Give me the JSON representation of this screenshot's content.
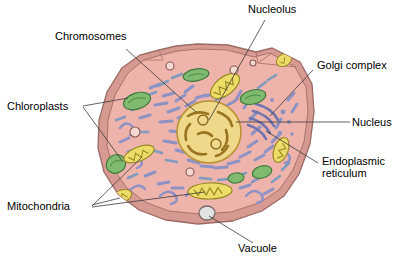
{
  "diagram": {
    "style": "hand-drawn colored biology illustration",
    "background_color": "#ffffff",
    "leader_line_color": "#3a3a3a"
  },
  "labels": [
    {
      "id": "chromosomes",
      "text": "Chromosomes",
      "x": 55,
      "y": 36,
      "align": "left"
    },
    {
      "id": "nucleolus",
      "text": "Nucleolus",
      "x": 248,
      "y": 8,
      "align": "left"
    },
    {
      "id": "golgi",
      "text": "Golgi complex",
      "x": 317,
      "y": 65,
      "align": "left"
    },
    {
      "id": "nucleus",
      "text": "Nucleus",
      "x": 352,
      "y": 117,
      "align": "left"
    },
    {
      "id": "er",
      "text": "Endoplasmic reticulum",
      "x": 322,
      "y": 161,
      "align": "left",
      "multiline": true
    },
    {
      "id": "vacuole",
      "text": "Vacuole",
      "x": 238,
      "y": 248,
      "align": "left"
    },
    {
      "id": "mitochondria",
      "text": "Mitochondria",
      "x": 7,
      "y": 202,
      "align": "left"
    },
    {
      "id": "chloroplasts",
      "text": "Chloroplasts",
      "x": 7,
      "y": 102,
      "align": "left"
    }
  ],
  "colors": {
    "cell_wall": "#d79a93",
    "cell_wall_outline": "#9c6a64",
    "cytoplasm": "#eeb3ab",
    "cytoplasm_outline": "#a8736c",
    "nucleus_fill": "#f0d88a",
    "nucleus_outline": "#b79335",
    "chromatin": "#9a7521",
    "nucleolus_fill": "#f0d88a",
    "nucleolus_outline": "#8a6a1c",
    "chloroplast_fill": "#7fba70",
    "chloroplast_outline": "#3f7a3a",
    "mitochondria_fill": "#eddc6a",
    "mitochondria_outline": "#9a8a22",
    "er_strand": "#8d92c4",
    "er_strand_alt": "#7f9bbf",
    "golgi": "#8d92c4",
    "vacuole_fill": "#e2e2e2",
    "vacuole_outline": "#7a6a66",
    "vesicle_fill": "#f6d9d3",
    "vesicle_outline": "#8a5f59"
  },
  "organelles": {
    "nucleus": {
      "label": "Nucleus",
      "cx": 209,
      "cy": 132,
      "rx": 32,
      "ry": 31
    },
    "nucleoli": [
      {
        "cx": 203,
        "cy": 120,
        "r": 5
      },
      {
        "cx": 216,
        "cy": 144,
        "r": 5
      }
    ],
    "chloroplasts": [
      {
        "cx": 137,
        "cy": 101,
        "rx": 14,
        "ry": 8,
        "rot": -18
      },
      {
        "cx": 196,
        "cy": 75,
        "rx": 13,
        "ry": 6,
        "rot": -10
      },
      {
        "cx": 253,
        "cy": 97,
        "rx": 13,
        "ry": 7,
        "rot": -14
      },
      {
        "cx": 116,
        "cy": 164,
        "rx": 10,
        "ry": 9,
        "rot": -30
      },
      {
        "cx": 262,
        "cy": 172,
        "rx": 10,
        "ry": 6,
        "rot": -16
      },
      {
        "cx": 236,
        "cy": 178,
        "rx": 8,
        "ry": 5,
        "rot": -8
      }
    ],
    "mitochondria": [
      {
        "cx": 225,
        "cy": 86,
        "rx": 17,
        "ry": 9,
        "rot": -38
      },
      {
        "cx": 139,
        "cy": 154,
        "rx": 16,
        "ry": 7,
        "rot": -22
      },
      {
        "cx": 210,
        "cy": 191,
        "rx": 22,
        "ry": 8,
        "rot": -2
      },
      {
        "cx": 281,
        "cy": 150,
        "rx": 9,
        "ry": 13,
        "rot": -70
      },
      {
        "cx": 122,
        "cy": 196,
        "rx": 10,
        "ry": 6,
        "rot": -18
      },
      {
        "cx": 284,
        "cy": 60,
        "rx": 8,
        "ry": 6,
        "rot": -30
      }
    ],
    "vacuole": {
      "cx": 207,
      "cy": 213,
      "rx": 8,
      "ry": 7
    },
    "vesicles": [
      {
        "cx": 170,
        "cy": 66,
        "r": 4
      },
      {
        "cx": 234,
        "cy": 70,
        "r": 4
      },
      {
        "cx": 135,
        "cy": 132,
        "r": 5
      },
      {
        "cx": 190,
        "cy": 172,
        "r": 4
      },
      {
        "cx": 253,
        "cy": 63,
        "r": 3
      }
    ],
    "golgi": {
      "label": "Golgi complex",
      "cx": 268,
      "cy": 117
    }
  },
  "leader_lines": [
    {
      "for": "chromosomes",
      "points": "126,49 196,112"
    },
    {
      "for": "nucleolus",
      "points": "265,20 209,120"
    },
    {
      "for": "golgi",
      "points": "313,70 270,116"
    },
    {
      "for": "nucleus",
      "points": "350,122 236,122"
    },
    {
      "for": "er",
      "points": "318,163 266,131"
    },
    {
      "for": "vacuole",
      "points": "253,243 209,216"
    },
    {
      "for": "mitochondria",
      "points": "92,206 142,157"
    },
    {
      "for": "mitochondria",
      "points": "92,207 205,192"
    },
    {
      "for": "mitochondria",
      "points": "92,205 120,198"
    },
    {
      "for": "chloroplasts",
      "points": "83,106 128,98"
    },
    {
      "for": "chloroplasts",
      "points": "83,107 123,162"
    }
  ]
}
